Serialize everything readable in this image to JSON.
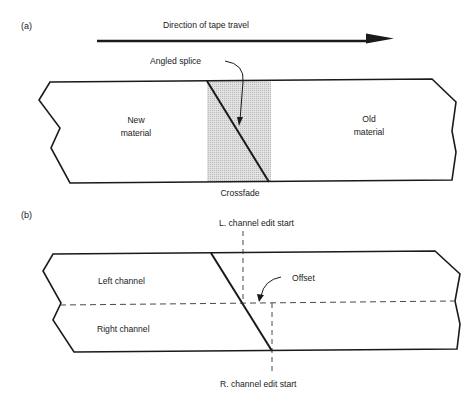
{
  "panel_a": {
    "label": "(a)",
    "direction_label": "Direction of tape travel",
    "angled_splice_label": "Angled splice",
    "new_material_line1": "New",
    "new_material_line2": "material",
    "old_material_line1": "Old",
    "old_material_line2": "material",
    "crossfade_label": "Crossfade"
  },
  "panel_b": {
    "label": "(b)",
    "l_channel_label": "L. channel edit start",
    "offset_label": "Offset",
    "left_channel_label": "Left channel",
    "right_channel_label": "Right channel",
    "r_channel_label": "R. channel edit start"
  },
  "colors": {
    "line": "#1a1a1a",
    "crossfade_fill": "#cfcfcf",
    "background": "#ffffff"
  }
}
